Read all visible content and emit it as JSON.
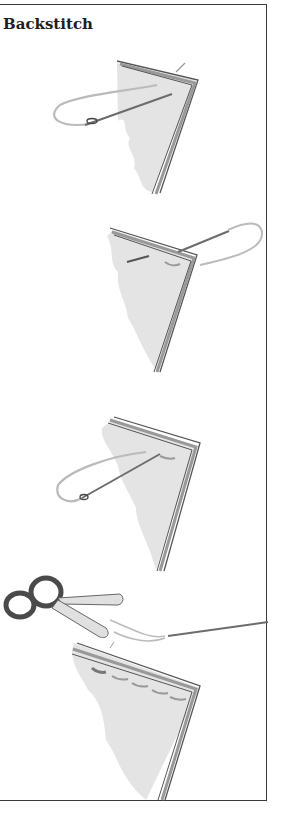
{
  "panel": {
    "title": "Backstitch",
    "steps": [
      {
        "name": "step-1",
        "description": "Needle brought up through folded fabric layers with thread loop"
      },
      {
        "name": "step-2",
        "description": "Needle passed back through fabric making first stitch"
      },
      {
        "name": "step-3",
        "description": "Needle inserted at end of previous stitch, thread loop"
      },
      {
        "name": "step-4",
        "description": "Completed row of backstitches; scissors trimming thread"
      }
    ],
    "colors": {
      "fabric": "#e4e4e4",
      "edge": "#5a5a5a",
      "thread": "#bdbdbd",
      "border": "#3a3a3a"
    }
  }
}
